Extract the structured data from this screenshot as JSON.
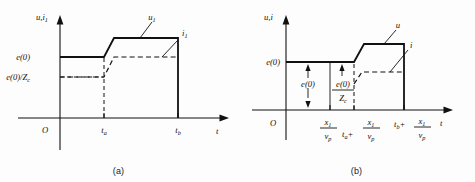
{
  "figure": {
    "background_color": "#fdfdfd",
    "ink_color": "#111111",
    "panels": [
      {
        "id": "a",
        "caption": "(a)",
        "y_axis_label_main": "u",
        "y_axis_label_comma": ",",
        "y_axis_label_second": "i",
        "y_axis_label_second_sub": "1",
        "x_axis_label": "t",
        "origin_label": "O",
        "y_ticks": [
          {
            "label_main": "e(0)",
            "label_sub": ""
          },
          {
            "label_main": "e(0)/Z",
            "label_sub": "c"
          }
        ],
        "x_ticks": [
          {
            "label_main": "t",
            "label_sub": "a"
          },
          {
            "label_main": "t",
            "label_sub": "b"
          }
        ],
        "curves": [
          {
            "name": "u1",
            "label_main": "u",
            "label_sub": "1",
            "style": "solid"
          },
          {
            "name": "i1",
            "label_main": "i",
            "label_sub": "1",
            "style": "dashed"
          }
        ]
      },
      {
        "id": "b",
        "caption": "(b)",
        "y_axis_label_main": "u",
        "y_axis_label_comma": ",",
        "y_axis_label_second": "i",
        "y_axis_label_second_sub": "",
        "x_axis_label": "t",
        "origin_label": "O",
        "y_ticks": [
          {
            "label_main": "e(0)",
            "label_sub": ""
          }
        ],
        "x_ticks": [
          {
            "numerator": "x",
            "numerator_sub": "1",
            "denominator": "v",
            "denominator_sub": "p",
            "prefix": ""
          },
          {
            "numerator": "x",
            "numerator_sub": "1",
            "denominator": "v",
            "denominator_sub": "p",
            "prefix": "t",
            "prefix_sub": "a",
            "prefix_op": "+"
          },
          {
            "numerator": "x",
            "numerator_sub": "1",
            "denominator": "v",
            "denominator_sub": "p",
            "prefix": "t",
            "prefix_sub": "b",
            "prefix_op": "+"
          }
        ],
        "annotations": [
          {
            "name": "amplitude-e0",
            "label_main": "e(0)",
            "label_sub": ""
          },
          {
            "name": "amplitude-e0-over-zc",
            "numerator": "e(0)",
            "denominator": "Z",
            "denominator_sub": "c"
          }
        ],
        "curves": [
          {
            "name": "u",
            "label_main": "u",
            "label_sub": "",
            "style": "solid"
          },
          {
            "name": "i",
            "label_main": "i",
            "label_sub": "",
            "style": "dashed"
          }
        ]
      }
    ]
  }
}
